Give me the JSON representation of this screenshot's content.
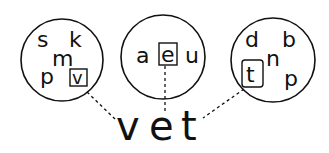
{
  "diagram": {
    "type": "phonics-word-building",
    "circles": [
      {
        "id": "onset",
        "letters": [
          "s",
          "k",
          "m",
          "p",
          "v"
        ],
        "selected": "v"
      },
      {
        "id": "vowel",
        "letters": [
          "a",
          "e",
          "u"
        ],
        "selected": "e"
      },
      {
        "id": "coda",
        "letters": [
          "d",
          "b",
          "n",
          "t",
          "p"
        ],
        "selected": "t"
      }
    ],
    "word": {
      "letters": [
        "v",
        "e",
        "t"
      ],
      "text": "vet"
    },
    "colors": {
      "ink": "#111111",
      "background": "#ffffff"
    }
  }
}
